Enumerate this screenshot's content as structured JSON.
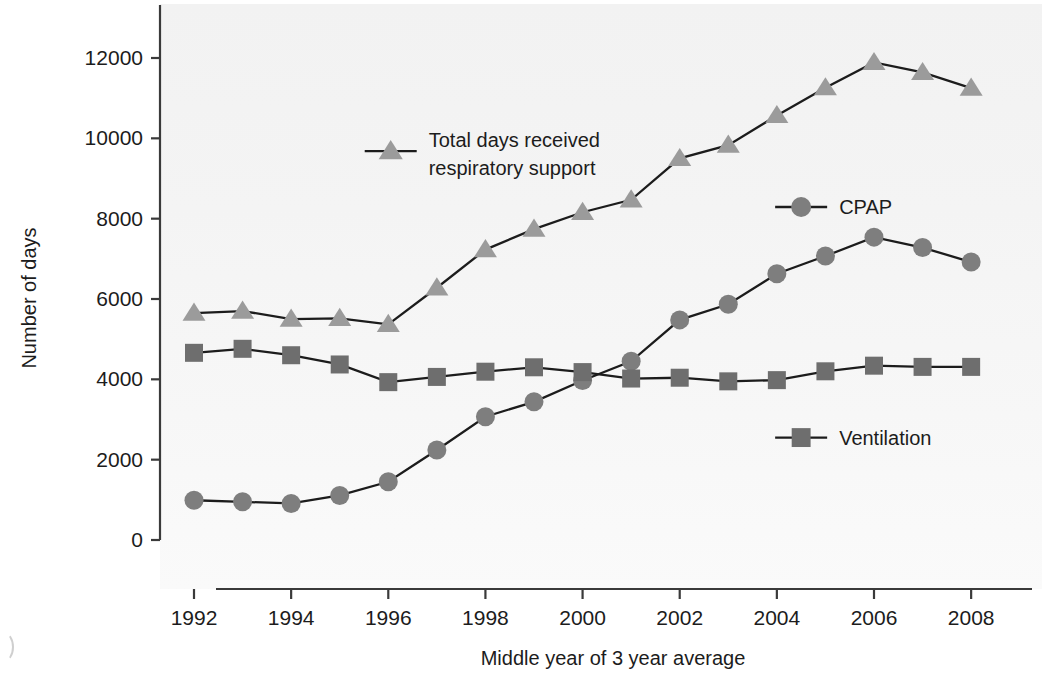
{
  "chart_data": {
    "type": "line",
    "title": "",
    "xlabel": "Middle year of 3 year average",
    "ylabel": "Number of days",
    "x": [
      1992,
      1993,
      1994,
      1995,
      1996,
      1997,
      1998,
      1999,
      2000,
      2001,
      2002,
      2003,
      2004,
      2005,
      2006,
      2007,
      2008
    ],
    "xlim": [
      1991.3,
      2008.8
    ],
    "ylim": [
      0,
      12800
    ],
    "xticks": [
      1992,
      1994,
      1996,
      1998,
      2000,
      2002,
      2004,
      2006,
      2008
    ],
    "xtick_labels": [
      "1992",
      "1994",
      "1996",
      "1998",
      "2000",
      "2002",
      "2004",
      "2006",
      "2008"
    ],
    "yticks": [
      0,
      2000,
      4000,
      6000,
      8000,
      10000,
      12000
    ],
    "ytick_labels": [
      "0",
      "2000",
      "4000",
      "6000",
      "8000",
      "10000",
      "12000"
    ],
    "grid": false,
    "legend_position": "inside-plot",
    "series": [
      {
        "name": "Total days received respiratory support",
        "marker": "triangle",
        "color": "#9b9b9b",
        "line_color": "#1c1c1c",
        "values": [
          5650,
          5700,
          5500,
          5520,
          5370,
          6280,
          7230,
          7740,
          8160,
          8470,
          9500,
          9830,
          10570,
          11260,
          11890,
          11640,
          11250
        ]
      },
      {
        "name": "CPAP",
        "marker": "circle",
        "color": "#7e7e7e",
        "line_color": "#1c1c1c",
        "values": [
          990,
          950,
          910,
          1110,
          1450,
          2240,
          3070,
          3440,
          3970,
          4450,
          5480,
          5870,
          6630,
          7070,
          7540,
          7280,
          6920
        ]
      },
      {
        "name": "Ventilation",
        "marker": "square",
        "color": "#6e6e6e",
        "line_color": "#1c1c1c",
        "values": [
          4660,
          4760,
          4600,
          4370,
          3930,
          4060,
          4190,
          4300,
          4180,
          4020,
          4040,
          3950,
          3980,
          4200,
          4340,
          4310,
          4310
        ]
      }
    ],
    "legend": [
      {
        "label_line1": "Total days received",
        "label_line2": "respiratory support",
        "marker": "triangle",
        "color": "#9b9b9b",
        "x": 1996.05,
        "y": 9680
      },
      {
        "label_line1": "CPAP",
        "label_line2": "",
        "marker": "circle",
        "color": "#7e7e7e",
        "x": 2004.5,
        "y": 8290
      },
      {
        "label_line1": "Ventilation",
        "label_line2": "",
        "marker": "square",
        "color": "#6e6e6e",
        "x": 2004.5,
        "y": 2550
      }
    ]
  }
}
